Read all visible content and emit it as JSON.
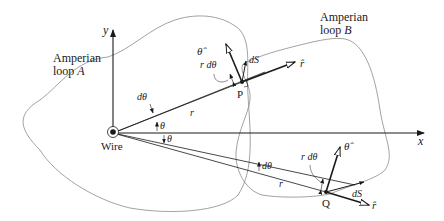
{
  "labels": {
    "y_axis": "y",
    "x_axis": "x",
    "loop_a_line1": "Amperian",
    "loop_a_line2_prefix": "loop ",
    "loop_a_letter": "A",
    "loop_b_line1": "Amperian",
    "loop_b_line2_prefix": "loop ",
    "loop_b_letter": "B",
    "wire": "Wire",
    "point_p": "P",
    "point_q": "Q",
    "theta_hat_p": "θ̂",
    "theta_hat_q": "θ̂",
    "r_hat_p": "r̂",
    "r_hat_q": "r̂",
    "r_dtheta_p": "r dθ",
    "r_dtheta_q": "r dθ",
    "ds_p": "dS⃗",
    "ds_q": "dS⃗",
    "dtheta_upper": "dθ",
    "dtheta_lower": "dθ",
    "r_upper": "r",
    "r_lower": "r",
    "theta_upper": "θ",
    "theta_lower": "θ"
  },
  "colors": {
    "line": "#1a1a1a",
    "loop": "#8a8a8a"
  }
}
